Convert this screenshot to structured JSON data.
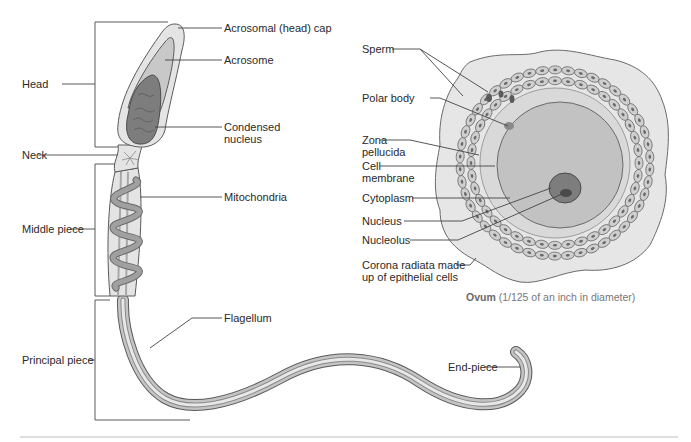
{
  "sperm": {
    "labels_right": {
      "acrosomal_cap": "Acrosomal (head) cap",
      "acrosome": "Acrosome",
      "condensed_nucleus_1": "Condensed",
      "condensed_nucleus_2": "nucleus",
      "mitochondria": "Mitochondria",
      "flagellum": "Flagellum",
      "end_piece": "End-piece"
    },
    "labels_left": {
      "head": "Head",
      "neck": "Neck",
      "middle_piece": "Middle piece",
      "principal_piece": "Principal piece"
    }
  },
  "ovum": {
    "labels": {
      "sperm": "Sperm",
      "polar_body": "Polar body",
      "zona_pellucida_1": "Zona",
      "zona_pellucida_2": "pellucida",
      "cell_membrane_1": "Cell",
      "cell_membrane_2": "membrane",
      "cytoplasm": "Cytoplasm",
      "nucleus": "Nucleus",
      "nucleolus": "Nucleolus",
      "corona_1": "Corona radiata made",
      "corona_2": "up of epithelial cells"
    },
    "caption_bold": "Ovum",
    "caption_rest": " (1/125 of an inch in diameter)"
  },
  "colors": {
    "outline": "#5a5a5a",
    "leader": "#444444",
    "sheath": "#e4e4e4",
    "acrosome": "#c8c8c8",
    "nucleus_dark": "#7d7d7d",
    "tail_mid": "#c4c4c4",
    "ovum_zona": "#d9d9d9",
    "ovum_cytoplasm": "#c2c2c2",
    "corona_bg": "#e6e6e6",
    "cell_fill": "#cfcfcf",
    "rule": "#bdbdbd"
  }
}
